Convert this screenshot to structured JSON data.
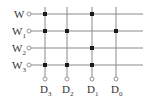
{
  "diagram": {
    "type": "rom-diode-matrix",
    "colors": {
      "line": "#8a8a8a",
      "dot": "#1a1a1a",
      "text": "#333333",
      "background": "#ffffff"
    },
    "word_lines": [
      {
        "label": "W",
        "sub": "",
        "y": 14
      },
      {
        "label": "W",
        "sub": "1",
        "y": 31
      },
      {
        "label": "W",
        "sub": "2",
        "y": 48
      },
      {
        "label": "W",
        "sub": "3",
        "y": 65
      }
    ],
    "bit_lines": [
      {
        "label": "D",
        "sub": "3",
        "x": 45
      },
      {
        "label": "D",
        "sub": "2",
        "x": 67
      },
      {
        "label": "D",
        "sub": "1",
        "x": 92
      },
      {
        "label": "D",
        "sub": "0",
        "x": 116
      }
    ],
    "connections": [
      {
        "word": 0,
        "bit": 0
      },
      {
        "word": 0,
        "bit": 2
      },
      {
        "word": 1,
        "bit": 0
      },
      {
        "word": 1,
        "bit": 1
      },
      {
        "word": 1,
        "bit": 3
      },
      {
        "word": 2,
        "bit": 2
      },
      {
        "word": 3,
        "bit": 0
      },
      {
        "word": 3,
        "bit": 1
      },
      {
        "word": 3,
        "bit": 2
      }
    ],
    "geometry": {
      "word_terminal_x": 29,
      "word_line_end_x": 143,
      "bit_line_top_y": 7,
      "bit_terminal_y": 79,
      "bit_label_y": 93
    }
  }
}
